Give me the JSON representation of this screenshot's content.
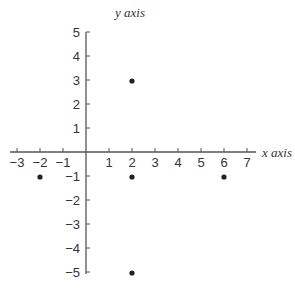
{
  "chart_data": {
    "type": "scatter",
    "title": "",
    "xlabel": "x axis",
    "ylabel": "y axis",
    "xlim": [
      -3,
      7
    ],
    "ylim": [
      -5,
      5
    ],
    "x_ticks": [
      -3,
      -2,
      -1,
      1,
      2,
      3,
      4,
      5,
      6,
      7
    ],
    "y_ticks": [
      5,
      4,
      3,
      2,
      1,
      -1,
      -2,
      -3,
      -4,
      -5
    ],
    "grid": false,
    "legend": null,
    "points": [
      {
        "x": 2,
        "y": 3
      },
      {
        "x": -2,
        "y": -1
      },
      {
        "x": 2,
        "y": -1
      },
      {
        "x": 6,
        "y": -1
      },
      {
        "x": 2,
        "y": -5
      }
    ],
    "colors": {
      "axis": "#555555",
      "point": "#222222",
      "text": "#333333"
    }
  }
}
